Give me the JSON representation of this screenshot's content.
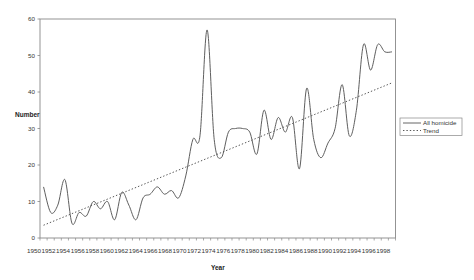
{
  "chart_data": {
    "type": "line",
    "title": "",
    "xlabel": "Year",
    "ylabel": "Number",
    "ylim": [
      0,
      60
    ],
    "yticks": [
      0,
      10,
      20,
      30,
      40,
      50,
      60
    ],
    "xtick_labels": [
      "1950",
      "1952",
      "1954",
      "1956",
      "1958",
      "1960",
      "1962",
      "1964",
      "1966",
      "1968",
      "1970",
      "1972",
      "1974",
      "1976",
      "1978",
      "1980",
      "1982",
      "1984",
      "1986",
      "1988",
      "1990",
      "1992",
      "1994",
      "1996",
      "1998"
    ],
    "grid": false,
    "legend_position": "right",
    "x": [
      1951,
      1952,
      1953,
      1954,
      1955,
      1956,
      1957,
      1958,
      1959,
      1960,
      1961,
      1962,
      1963,
      1964,
      1965,
      1966,
      1967,
      1968,
      1969,
      1970,
      1971,
      1972,
      1973,
      1974,
      1975,
      1976,
      1977,
      1978,
      1979,
      1980,
      1981,
      1982,
      1983,
      1984,
      1985,
      1986,
      1987,
      1988,
      1989,
      1990,
      1991,
      1992,
      1993,
      1994,
      1995,
      1996,
      1997,
      1998,
      1999,
      2000
    ],
    "series": [
      {
        "name": "All homicide",
        "style": "solid",
        "color": "#555555",
        "values": [
          14,
          7,
          9,
          16,
          4,
          7,
          6,
          10,
          8,
          10,
          5,
          12.5,
          9,
          5,
          11,
          12,
          14,
          12,
          13,
          11,
          17,
          27,
          28,
          57,
          27,
          22,
          29,
          30,
          30,
          29,
          23,
          35,
          27,
          33,
          29,
          33,
          19,
          41,
          27,
          22,
          26,
          30,
          42,
          28,
          35,
          53,
          46,
          53,
          51,
          51
        ]
      },
      {
        "name": "Trend",
        "style": "dotted",
        "color": "#444444",
        "values_linear": {
          "start": 3.5,
          "end": 42.5
        }
      }
    ]
  },
  "legend": {
    "items": [
      {
        "label": "All homicide",
        "style": "solid"
      },
      {
        "label": "Trend",
        "style": "dotted"
      }
    ]
  }
}
